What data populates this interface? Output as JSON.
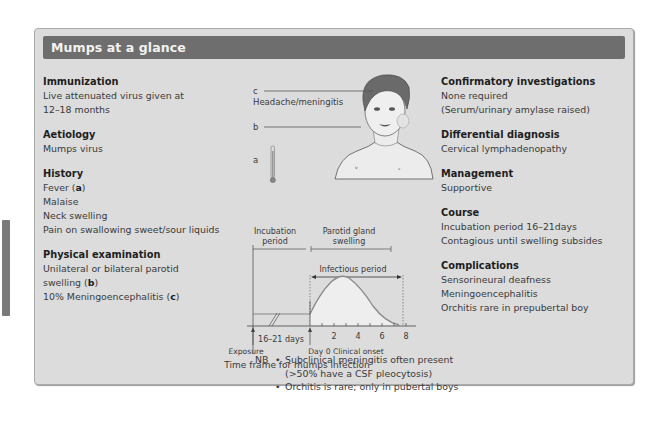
{
  "title": "Mumps at a glance",
  "left_sections": [
    {
      "heading": "Immunization",
      "lines": [
        "Live attenuated virus given at",
        "12–18 months"
      ]
    },
    {
      "heading": "Aetiology",
      "lines": [
        "Mumps virus"
      ]
    },
    {
      "heading": "History",
      "lines": [
        "Fever (a)",
        "Malaise",
        "Neck swelling",
        "Pain on swallowing sweet/sour liquids"
      ]
    },
    {
      "heading": "Physical examination",
      "lines": [
        "Unilateral or bilateral parotid",
        "swelling (b)",
        "10% Meningoencephalitis (c)"
      ]
    }
  ],
  "right_sections": [
    {
      "heading": "Confirmatory investigations",
      "lines": [
        "None required",
        "(Serum/urinary amylase raised)"
      ]
    },
    {
      "heading": "Differential diagnosis",
      "lines": [
        "Cervical lymphadenopathy"
      ]
    },
    {
      "heading": "Management",
      "lines": [
        "Supportive"
      ]
    },
    {
      "heading": "Course",
      "lines": [
        "Incubation period 16–21days",
        "Contagious until swelling subsides"
      ]
    },
    {
      "heading": "Complications",
      "lines": [
        "Sensorineural deafness",
        "Meningoencephalitis",
        "Orchitis rare in prepubertal boy"
      ]
    }
  ],
  "illustration": {
    "label_c": "c",
    "label_c_text": "Headache/meningitis",
    "label_b": "b",
    "label_a": "a"
  },
  "timeline": {
    "incubation_label_1": "Incubation",
    "incubation_label_2": "period",
    "parotid_label_1": "Parotid gland",
    "parotid_label_2": "swelling",
    "infectious_label": "Infectious period",
    "days_label": "16–21 days",
    "ticks": [
      "2",
      "4",
      "6",
      "8"
    ],
    "exposure_label": "Exposure",
    "onset_label": "Day 0 Clinical onset",
    "caption": "Time frame for mumps infection"
  },
  "nb": {
    "label": "NB",
    "items": [
      "Subclinical meningitis often present",
      "(>50% have a CSF pleocytosis)",
      "Orchitis is rare; only in pubertal boys"
    ]
  },
  "colors": {
    "header_bg": "#6e6e6e",
    "panel_bg": "#dcdcdc",
    "curve_fill": "#eeeeee",
    "curve_stroke": "#8a8a8a"
  }
}
